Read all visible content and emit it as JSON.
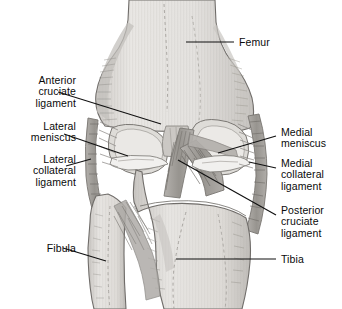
{
  "figure": {
    "view": "anterior",
    "background_color": "#ffffff",
    "ink_color": "#0a0a0a"
  },
  "palette": {
    "bone_light": "#e6e4e1",
    "bone_mid": "#d2cfcb",
    "bone_shadow": "#b9b6b2",
    "cartilage": "#f2f1ef",
    "ligament_mid": "#a8a5a1",
    "ligament_dark": "#8d8a86",
    "outline": "#6f6c69",
    "hatch": "#97948f",
    "leader_line": "#111111"
  },
  "labels": [
    {
      "id": "femur",
      "text": "Femur",
      "align": "left",
      "x": 239,
      "y": 37,
      "leader": {
        "x1": 186,
        "y1": 42,
        "x2": 234,
        "y2": 42
      }
    },
    {
      "id": "anterior-cruciate-ligament",
      "text": "Anterior\ncruciate\nligament",
      "align": "right",
      "x": 14,
      "y": 75,
      "leader": {
        "x1": 58,
        "y1": 92,
        "x2": 161,
        "y2": 124
      }
    },
    {
      "id": "lateral-meniscus",
      "text": "Lateral\nmeniscus",
      "align": "right",
      "x": 14,
      "y": 121,
      "leader": {
        "x1": 64,
        "y1": 134,
        "x2": 128,
        "y2": 156
      }
    },
    {
      "id": "lateral-collateral-ligament",
      "text": "Lateral\ncollateral\nligament",
      "align": "right",
      "x": 14,
      "y": 154,
      "leader": {
        "x1": 66,
        "y1": 166,
        "x2": 91,
        "y2": 159
      }
    },
    {
      "id": "fibula",
      "text": "Fibula",
      "align": "right",
      "x": 14,
      "y": 243,
      "leader": {
        "x1": 63,
        "y1": 248,
        "x2": 106,
        "y2": 261
      }
    },
    {
      "id": "medial-meniscus",
      "text": "Medial\nmeniscus",
      "align": "left",
      "x": 281,
      "y": 127,
      "leader": {
        "x1": 276,
        "y1": 136,
        "x2": 218,
        "y2": 153
      }
    },
    {
      "id": "medial-collateral-ligament",
      "text": "Medial\ncollateral\nligament",
      "align": "left",
      "x": 281,
      "y": 158,
      "leader": {
        "x1": 276,
        "y1": 168,
        "x2": 249,
        "y2": 162
      }
    },
    {
      "id": "posterior-cruciate-ligament",
      "text": "Posterior\ncruciate\nligament",
      "align": "left",
      "x": 281,
      "y": 205,
      "leader": {
        "x1": 276,
        "y1": 215,
        "x2": 178,
        "y2": 160
      }
    },
    {
      "id": "tibia",
      "text": "Tibia",
      "align": "left",
      "x": 281,
      "y": 254,
      "leader": {
        "x1": 276,
        "y1": 259,
        "x2": 176,
        "y2": 259
      }
    }
  ],
  "structures": [
    {
      "id": "femur",
      "name": "Femur",
      "region": "upper bone, shaft narrowing superiorly, flaring into two condyles"
    },
    {
      "id": "tibia",
      "name": "Tibia",
      "region": "lower medial bone, broad plateau"
    },
    {
      "id": "fibula",
      "name": "Fibula",
      "region": "lower lateral slender bone"
    },
    {
      "id": "acl",
      "name": "Anterior cruciate ligament",
      "region": "intercondylar, runs superolateral"
    },
    {
      "id": "pcl",
      "name": "Posterior cruciate ligament",
      "region": "intercondylar, crosses ACL"
    },
    {
      "id": "lcl",
      "name": "Lateral collateral ligament",
      "region": "lateral joint margin, vertical band"
    },
    {
      "id": "mcl",
      "name": "Medial collateral ligament",
      "region": "medial joint margin, broad band"
    },
    {
      "id": "lat-meniscus",
      "name": "Lateral meniscus",
      "region": "lateral tibial plateau, wedge"
    },
    {
      "id": "med-meniscus",
      "name": "Medial meniscus",
      "region": "medial tibial plateau, wedge"
    }
  ]
}
